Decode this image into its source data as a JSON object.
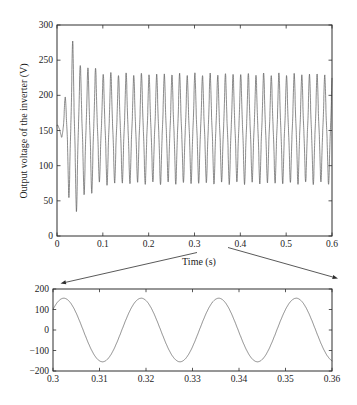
{
  "figure": {
    "background": "#ffffff",
    "line_color": "#5a5a5a",
    "axis_color": "#2e2e2e",
    "text_color": "#1c1c1c"
  },
  "chart_data": [
    {
      "id": "full-view",
      "type": "line",
      "title": "",
      "xlabel": "Time (s)",
      "ylabel": "Output voltage of the inverter (V)",
      "xlim": [
        0,
        0.6
      ],
      "ylim": [
        0,
        300
      ],
      "xticks": [
        "0",
        "0.1",
        "0.2",
        "0.3",
        "0.4",
        "0.5",
        "0.6"
      ],
      "xtick_values": [
        0,
        0.1,
        0.2,
        0.3,
        0.4,
        0.5,
        0.6
      ],
      "yticks": [
        "0",
        "50",
        "100",
        "150",
        "200",
        "250",
        "300"
      ],
      "ytick_values": [
        0,
        50,
        100,
        150,
        200,
        250,
        300
      ],
      "grid": false,
      "legend": null,
      "signal": {
        "model": "damped-startup-sine",
        "description": "60 Hz inverter output voltage: startup transient (max peak ~277 V, deepest trough ~37 V) settling to steady oscillation between ~75 V and ~230 V around a ~152.5 V midline",
        "offset_v": 152.5,
        "frequency_hz": 60,
        "polarity": -1,
        "phase_delay_s": 0.005,
        "third_harmonic_ratio": -0.14,
        "envelope_t_s": [
          0,
          0.009,
          0.0175,
          0.026,
          0.0342,
          0.0425,
          0.0508,
          0.059,
          0.0675,
          0.076,
          0.0842,
          0.094,
          0.104,
          0.119,
          0.139,
          0.6
        ],
        "envelope_a_v": [
          3,
          8,
          45,
          100,
          124,
          116,
          90,
          96,
          87,
          90,
          85,
          76,
          80,
          78,
          77.5,
          77.5
        ],
        "ripple_a_v": 2,
        "ripple_hz": 27,
        "steady_peak_v": 230,
        "steady_trough_v": 75,
        "max_transient_peak_v": 277,
        "min_transient_trough_v": 37
      }
    },
    {
      "id": "zoom-view",
      "type": "line",
      "title": "",
      "xlabel": "",
      "ylabel": "",
      "xlim": [
        0.3,
        0.36
      ],
      "ylim": [
        -200,
        200
      ],
      "xticks": [
        "0.3",
        "0.31",
        "0.32",
        "0.33",
        "0.34",
        "0.35",
        "0.36"
      ],
      "xtick_values": [
        0.3,
        0.31,
        0.32,
        0.33,
        0.34,
        0.35,
        0.36
      ],
      "yticks": [
        "−200",
        "−100",
        "0",
        "100",
        "200"
      ],
      "ytick_values": [
        -200,
        -100,
        0,
        100,
        200
      ],
      "grid": false,
      "legend": null,
      "signal": {
        "model": "sine",
        "description": "Zoomed steady-state window: clean 60 Hz sine, amplitude ~155 V, value ~+100 V rising at t = 0.3 s; four peaks at ~0.302, 0.319, 0.335, 0.352 s",
        "offset_v": 0,
        "amplitude_v": 155,
        "frequency_hz": 60,
        "phase_rad": 0.7
      }
    }
  ],
  "annotations": {
    "zoom_link": {
      "region_s": [
        0.3,
        0.36
      ],
      "arrows": [
        {
          "from": "time-axis region near 0.3 s",
          "to": "top-left corner of zoom plot"
        },
        {
          "from": "time-axis region near 0.37 s",
          "to": "top-right corner of zoom plot"
        }
      ]
    }
  }
}
